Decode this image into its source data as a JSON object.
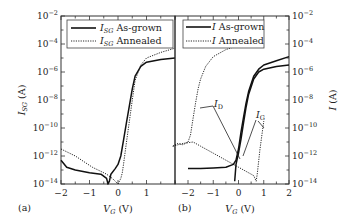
{
  "figure": {
    "panel_a_label": "(a)",
    "panel_b_label": "(b)"
  },
  "panel_a": {
    "ylabel_main": "I",
    "ylabel_sub": "SG",
    "ylabel_unit": " (A)",
    "xlabel_main": "V",
    "xlabel_sub": "G",
    "xlabel_unit": " (V)",
    "legend": [
      {
        "main": "I",
        "sub": "SG",
        "text": " As-grown",
        "style": "solid"
      },
      {
        "main": "I",
        "sub": "SG",
        "text": " Annealed",
        "style": "dotted"
      }
    ]
  },
  "panel_b": {
    "ylabel_main": "I",
    "ylabel_unit": " (A)",
    "xlabel_main": "V",
    "xlabel_sub": "G",
    "xlabel_unit": " (V)",
    "legend": [
      {
        "main": "I",
        "text": " As-grown",
        "style": "solid"
      },
      {
        "main": "I",
        "text": " Annealed",
        "style": "dotted"
      }
    ],
    "annotations": [
      {
        "main": "I",
        "sub": "D"
      },
      {
        "main": "I",
        "sub": "G"
      }
    ]
  },
  "chart_data": [
    {
      "type": "line",
      "title": "(a)",
      "xlabel": "V_G (V)",
      "ylabel": "I_SG (A)",
      "yscale": "log",
      "xlim": [
        -2,
        2
      ],
      "ylim": [
        1e-14,
        0.01
      ],
      "xticks": [
        "-2",
        "-1",
        "0",
        "1"
      ],
      "yticks": [
        "10^-2",
        "10^-4",
        "10^-6",
        "10^-8",
        "10^-10",
        "10^-12",
        "10^-14"
      ],
      "legend_position": "upper left",
      "series": [
        {
          "name": "I_SG As-grown",
          "style": "solid",
          "x": [
            -2.0,
            -1.8,
            -1.5,
            -1.0,
            -0.6,
            -0.4,
            -0.35,
            -0.3,
            -0.25,
            -0.1,
            0.0,
            0.1,
            0.2,
            0.3,
            0.4,
            0.5,
            0.6,
            0.8,
            1.0,
            1.5,
            2.0
          ],
          "log10_y": [
            -12.3,
            -12.8,
            -13.0,
            -13.2,
            -13.3,
            -13.6,
            -14.0,
            -13.8,
            -13.3,
            -12.9,
            -12.6,
            -12.0,
            -10.8,
            -9.6,
            -8.4,
            -7.2,
            -6.3,
            -5.6,
            -5.3,
            -5.1,
            -5.0
          ]
        },
        {
          "name": "I_SG Annealed",
          "style": "dotted",
          "x": [
            -2.0,
            -1.8,
            -1.5,
            -1.2,
            -0.9,
            -0.6,
            -0.4,
            -0.2,
            0.0,
            0.1,
            0.15,
            0.2,
            0.3,
            0.4,
            0.5,
            0.6,
            0.8,
            1.0,
            1.5,
            2.0
          ],
          "log10_y": [
            -11.5,
            -11.7,
            -12.0,
            -12.4,
            -12.8,
            -13.1,
            -13.3,
            -13.6,
            -14.0,
            -13.6,
            -13.2,
            -12.5,
            -11.0,
            -9.5,
            -8.0,
            -6.6,
            -5.5,
            -5.0,
            -4.6,
            -4.3
          ]
        }
      ]
    },
    {
      "type": "line",
      "title": "(b)",
      "xlabel": "V_G (V)",
      "ylabel": "I (A)",
      "yscale": "log",
      "xlim": [
        -2.6,
        2
      ],
      "ylim": [
        1e-14,
        0.01
      ],
      "xticks": [
        "-2",
        "-1",
        "0",
        "1",
        "2"
      ],
      "yticks": [
        "10^-2",
        "10^-4",
        "10^-6",
        "10^-8",
        "10^-10",
        "10^-12",
        "10^-14"
      ],
      "legend_position": "upper left",
      "annotations": [
        "I_D",
        "I_G"
      ],
      "series": [
        {
          "name": "I_D As-grown",
          "style": "solid",
          "x": [
            -2.0,
            -1.5,
            -1.0,
            -0.5,
            -0.2,
            -0.1,
            0.0,
            0.1,
            0.2,
            0.3,
            0.4,
            0.6,
            0.8,
            1.0,
            1.5,
            2.0
          ],
          "log10_y": [
            -12.9,
            -12.9,
            -12.85,
            -12.8,
            -12.6,
            -12.3,
            -11.5,
            -10.3,
            -9.2,
            -8.2,
            -7.4,
            -6.3,
            -5.8,
            -5.5,
            -5.2,
            -4.9
          ]
        },
        {
          "name": "I_G As-grown",
          "style": "solid",
          "x": [
            -0.15,
            -0.1,
            0.0,
            0.1,
            0.2,
            0.3,
            0.4,
            0.6,
            0.8,
            1.0,
            1.5,
            2.0
          ],
          "log10_y": [
            -13.8,
            -12.6,
            -11.8,
            -10.8,
            -9.6,
            -8.5,
            -7.6,
            -6.5,
            -6.0,
            -5.8,
            -5.6,
            -5.5
          ]
        },
        {
          "name": "I_D Annealed",
          "style": "dotted",
          "x": [
            -2.6,
            -2.4,
            -2.2,
            -2.0,
            -1.9,
            -1.8,
            -1.7,
            -1.6,
            -1.5,
            -1.3,
            -1.0,
            -0.5,
            0.0,
            0.5,
            0.7
          ],
          "log10_y": [
            -11.3,
            -11.1,
            -11.2,
            -11.0,
            -10.5,
            -9.3,
            -8.2,
            -7.2,
            -6.5,
            -5.6,
            -4.9,
            -4.4,
            -4.1,
            -3.9,
            -3.7
          ]
        },
        {
          "name": "I_G Annealed",
          "style": "dotted",
          "x": [
            -2.6,
            -2.2,
            -1.8,
            -1.5,
            -1.0,
            -0.5,
            0.0,
            0.3,
            0.6,
            0.7,
            0.75,
            0.85,
            1.0
          ],
          "log10_y": [
            -11.3,
            -11.1,
            -11.0,
            -11.3,
            -11.8,
            -12.3,
            -12.8,
            -13.1,
            -13.4,
            -13.8,
            -13.2,
            -11.5,
            -9.5
          ]
        }
      ]
    }
  ]
}
